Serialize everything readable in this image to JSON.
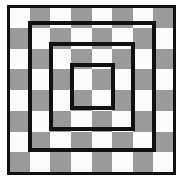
{
  "figure": {
    "type": "geometric-diagram",
    "canvas": {
      "width": 183,
      "height": 180,
      "background": "#ffffff"
    }
  },
  "checkerboard": {
    "name": "checkerboard",
    "rows": 8,
    "columns": 8,
    "light_color": "#fbfbfb",
    "dark_color": "#9a9a9a",
    "origin": {
      "x": 9,
      "y": 7
    },
    "size": {
      "width": 165,
      "height": 166
    },
    "cell_size": {
      "width": 20.6,
      "height": 20.75
    },
    "top_left_cell": "light",
    "pattern": [
      [
        "light",
        "dark",
        "light",
        "dark",
        "light",
        "dark",
        "light",
        "dark"
      ],
      [
        "dark",
        "light",
        "dark",
        "light",
        "dark",
        "light",
        "dark",
        "light"
      ],
      [
        "light",
        "dark",
        "light",
        "dark",
        "light",
        "dark",
        "light",
        "dark"
      ],
      [
        "dark",
        "light",
        "dark",
        "light",
        "dark",
        "light",
        "dark",
        "light"
      ],
      [
        "light",
        "dark",
        "light",
        "dark",
        "light",
        "dark",
        "light",
        "dark"
      ],
      [
        "dark",
        "light",
        "dark",
        "light",
        "dark",
        "light",
        "dark",
        "light"
      ],
      [
        "light",
        "dark",
        "light",
        "dark",
        "light",
        "dark",
        "light",
        "dark"
      ],
      [
        "dark",
        "light",
        "dark",
        "light",
        "dark",
        "light",
        "dark",
        "light"
      ]
    ]
  },
  "rings": [
    {
      "name": "outer-square",
      "index": 1,
      "stroke_color": "#111111",
      "stroke_width": 3,
      "left": 7,
      "top": 5,
      "width": 169,
      "height": 170,
      "cells_enclosed": "8 x 8"
    },
    {
      "name": "second-square",
      "index": 2,
      "stroke_color": "#111111",
      "stroke_width": 4,
      "left": 28,
      "top": 21,
      "width": 128,
      "height": 131,
      "cells_enclosed": "6 x 6"
    },
    {
      "name": "third-square",
      "index": 3,
      "stroke_color": "#111111",
      "stroke_width": 4,
      "left": 49,
      "top": 42,
      "width": 86,
      "height": 89,
      "cells_enclosed": "4 x 4"
    },
    {
      "name": "inner-square",
      "index": 4,
      "stroke_color": "#111111",
      "stroke_width": 4,
      "left": 70,
      "top": 63,
      "width": 45,
      "height": 47,
      "cells_enclosed": "2 x 2"
    }
  ]
}
